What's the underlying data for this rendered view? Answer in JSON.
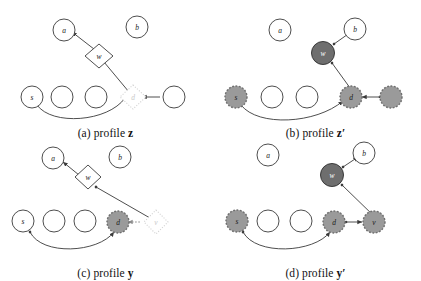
{
  "figure": {
    "kind": "four-panel graph diagram",
    "colors": {
      "stroke": "#3a3a3a",
      "fill_white": "#ffffff",
      "fill_gray": "#9a9a9a",
      "fill_dark_gray": "#6e6e6e",
      "ghost": "#d8d8d8",
      "text": "#111111"
    },
    "panels": [
      {
        "id": "a",
        "caption_prefix": "(a)",
        "caption_word": "profile",
        "caption_symbol": "z",
        "caption_prime": "",
        "nodes": [
          {
            "name": "a",
            "label": "a",
            "shape": "circle",
            "style": "outline"
          },
          {
            "name": "b",
            "label": "b",
            "shape": "circle",
            "style": "outline"
          },
          {
            "name": "w",
            "label": "w",
            "shape": "diamond",
            "style": "outline"
          },
          {
            "name": "s",
            "label": "s",
            "shape": "circle",
            "style": "outline"
          },
          {
            "name": "n2",
            "label": "",
            "shape": "circle",
            "style": "outline"
          },
          {
            "name": "n3",
            "label": "",
            "shape": "circle",
            "style": "outline"
          },
          {
            "name": "d",
            "label": "d",
            "shape": "diamond",
            "style": "ghost-dotted"
          },
          {
            "name": "v",
            "label": "",
            "shape": "circle",
            "style": "outline"
          }
        ],
        "edges": [
          {
            "from": "w",
            "to": "a",
            "kind": "arrow"
          },
          {
            "from": "d",
            "to": "w",
            "kind": "arrow"
          },
          {
            "from": "s",
            "to": "d",
            "kind": "curved-arrow"
          },
          {
            "from": "v",
            "to": "d",
            "kind": "arrow"
          }
        ]
      },
      {
        "id": "b",
        "caption_prefix": "(b)",
        "caption_word": "profile",
        "caption_symbol": "z",
        "caption_prime": "′",
        "nodes": [
          {
            "name": "a",
            "label": "a",
            "shape": "circle",
            "style": "outline"
          },
          {
            "name": "b",
            "label": "b",
            "shape": "circle",
            "style": "outline"
          },
          {
            "name": "w",
            "label": "w",
            "shape": "circle",
            "style": "filled-dark"
          },
          {
            "name": "s",
            "label": "s",
            "shape": "circle",
            "style": "filled-dashed"
          },
          {
            "name": "n2",
            "label": "",
            "shape": "circle",
            "style": "outline"
          },
          {
            "name": "n3",
            "label": "",
            "shape": "circle",
            "style": "outline"
          },
          {
            "name": "d",
            "label": "d",
            "shape": "circle",
            "style": "filled-dashed"
          },
          {
            "name": "v",
            "label": "",
            "shape": "circle",
            "style": "filled-dashed"
          }
        ],
        "edges": [
          {
            "from": "w",
            "to": "b",
            "kind": "arrow"
          },
          {
            "from": "d",
            "to": "w",
            "kind": "arrow"
          },
          {
            "from": "s",
            "to": "d",
            "kind": "curved-arrow"
          },
          {
            "from": "v",
            "to": "d",
            "kind": "arrow"
          }
        ]
      },
      {
        "id": "c",
        "caption_prefix": "(c)",
        "caption_word": "profile",
        "caption_symbol": "y",
        "caption_prime": "",
        "nodes": [
          {
            "name": "a",
            "label": "a",
            "shape": "circle",
            "style": "outline"
          },
          {
            "name": "b",
            "label": "b",
            "shape": "circle",
            "style": "outline"
          },
          {
            "name": "w",
            "label": "w",
            "shape": "diamond",
            "style": "outline"
          },
          {
            "name": "s",
            "label": "s",
            "shape": "circle",
            "style": "outline"
          },
          {
            "name": "n2",
            "label": "",
            "shape": "circle",
            "style": "outline"
          },
          {
            "name": "n3",
            "label": "",
            "shape": "circle",
            "style": "outline"
          },
          {
            "name": "d",
            "label": "d",
            "shape": "circle",
            "style": "filled-dashed"
          },
          {
            "name": "v",
            "label": "v",
            "shape": "diamond",
            "style": "ghost-dotted"
          }
        ],
        "edges": [
          {
            "from": "w",
            "to": "a",
            "kind": "arrow"
          },
          {
            "from": "v",
            "to": "w",
            "kind": "arrow"
          },
          {
            "from": "s",
            "to": "d",
            "kind": "curved-arrow"
          },
          {
            "from": "v",
            "to": "d",
            "kind": "ghost-arrow"
          }
        ]
      },
      {
        "id": "d",
        "caption_prefix": "(d)",
        "caption_word": "profile",
        "caption_symbol": "y",
        "caption_prime": "′",
        "nodes": [
          {
            "name": "a",
            "label": "a",
            "shape": "circle",
            "style": "outline"
          },
          {
            "name": "b",
            "label": "b",
            "shape": "circle",
            "style": "outline"
          },
          {
            "name": "w",
            "label": "w",
            "shape": "circle",
            "style": "filled-dark"
          },
          {
            "name": "s",
            "label": "s",
            "shape": "circle",
            "style": "filled-dashed"
          },
          {
            "name": "n2",
            "label": "",
            "shape": "circle",
            "style": "outline"
          },
          {
            "name": "n3",
            "label": "",
            "shape": "circle",
            "style": "outline"
          },
          {
            "name": "d",
            "label": "d",
            "shape": "circle",
            "style": "filled-dashed"
          },
          {
            "name": "v",
            "label": "v",
            "shape": "circle",
            "style": "filled-dashed"
          }
        ],
        "edges": [
          {
            "from": "w",
            "to": "b",
            "kind": "arrow"
          },
          {
            "from": "v",
            "to": "w",
            "kind": "arrow"
          },
          {
            "from": "s",
            "to": "d",
            "kind": "curved-arrow"
          },
          {
            "from": "d",
            "to": "v",
            "kind": "arrow"
          }
        ]
      }
    ]
  }
}
